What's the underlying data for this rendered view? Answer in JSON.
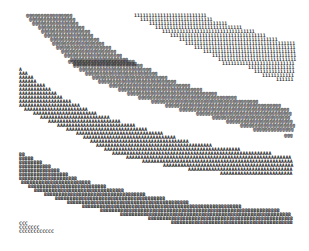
{
  "figure": {
    "char_width": 2.9,
    "row_height": 3.9,
    "bands": [
      {
        "name": "band-at",
        "char": "@",
        "color": "#222222",
        "rows": [
          {
            "y": 16,
            "x": 26,
            "n": 16
          },
          {
            "y": 20,
            "x": 29,
            "n": 16
          },
          {
            "y": 24,
            "x": 32,
            "n": 16
          },
          {
            "y": 28,
            "x": 38,
            "n": 16
          },
          {
            "y": 32,
            "x": 41,
            "n": 17
          },
          {
            "y": 36,
            "x": 44,
            "n": 17
          },
          {
            "y": 40,
            "x": 50,
            "n": 17
          },
          {
            "y": 44,
            "x": 52,
            "n": 18
          },
          {
            "y": 48,
            "x": 56,
            "n": 19
          },
          {
            "y": 52,
            "x": 61,
            "n": 19
          },
          {
            "y": 56,
            "x": 64,
            "n": 20
          },
          {
            "y": 60,
            "x": 70,
            "n": 20
          },
          {
            "y": 64,
            "x": 73,
            "n": 22
          }
        ]
      },
      {
        "name": "band-one",
        "char": "1",
        "color": "#333333",
        "rows": [
          {
            "y": 16,
            "x": 134,
            "n": 25
          },
          {
            "y": 20,
            "x": 140,
            "n": 25
          },
          {
            "y": 24,
            "x": 149,
            "n": 27
          },
          {
            "y": 28,
            "x": 155,
            "n": 30
          },
          {
            "y": 32,
            "x": 162,
            "n": 32
          },
          {
            "y": 36,
            "x": 170,
            "n": 33
          },
          {
            "y": 40,
            "x": 179,
            "n": 34
          },
          {
            "y": 44,
            "x": 185,
            "n": 38
          },
          {
            "y": 48,
            "x": 194,
            "n": 35
          },
          {
            "y": 52,
            "x": 203,
            "n": 32
          },
          {
            "y": 56,
            "x": 212,
            "n": 29
          },
          {
            "y": 60,
            "x": 218,
            "n": 27
          },
          {
            "y": 64,
            "x": 222,
            "n": 25
          },
          {
            "y": 68,
            "x": 248,
            "n": 16
          },
          {
            "y": 72,
            "x": 254,
            "n": 14
          },
          {
            "y": 76,
            "x": 262,
            "n": 11
          },
          {
            "y": 80,
            "x": 276,
            "n": 6
          }
        ]
      },
      {
        "name": "band-a",
        "char": "A",
        "color": "#222222",
        "rows": [
          {
            "y": 60,
            "x": 68,
            "n": 0
          },
          {
            "y": 70,
            "x": 19,
            "n": 1
          },
          {
            "y": 74,
            "x": 19,
            "n": 3
          },
          {
            "y": 78,
            "x": 19,
            "n": 5
          },
          {
            "y": 82,
            "x": 19,
            "n": 6
          },
          {
            "y": 86,
            "x": 19,
            "n": 9
          },
          {
            "y": 90,
            "x": 19,
            "n": 11
          },
          {
            "y": 94,
            "x": 19,
            "n": 13
          },
          {
            "y": 98,
            "x": 19,
            "n": 15
          },
          {
            "y": 102,
            "x": 19,
            "n": 18
          },
          {
            "y": 106,
            "x": 19,
            "n": 21
          },
          {
            "y": 110,
            "x": 24,
            "n": 22
          },
          {
            "y": 114,
            "x": 33,
            "n": 22
          },
          {
            "y": 118,
            "x": 40,
            "n": 24
          },
          {
            "y": 122,
            "x": 48,
            "n": 25
          },
          {
            "y": 126,
            "x": 57,
            "n": 27
          },
          {
            "y": 130,
            "x": 66,
            "n": 28
          },
          {
            "y": 134,
            "x": 76,
            "n": 30
          },
          {
            "y": 138,
            "x": 83,
            "n": 32
          },
          {
            "y": 142,
            "x": 90,
            "n": 34
          },
          {
            "y": 146,
            "x": 96,
            "n": 40
          },
          {
            "y": 150,
            "x": 104,
            "n": 47
          },
          {
            "y": 154,
            "x": 112,
            "n": 55
          },
          {
            "y": 158,
            "x": 126,
            "n": 57
          },
          {
            "y": 162,
            "x": 142,
            "n": 52
          },
          {
            "y": 166,
            "x": 163,
            "n": 45
          },
          {
            "y": 170,
            "x": 188,
            "n": 36
          },
          {
            "y": 174,
            "x": 220,
            "n": 25
          }
        ]
      },
      {
        "name": "band-a-upper",
        "char": "@",
        "color": "#222222",
        "rows": [
          {
            "y": 62,
            "x": 68,
            "n": 23
          },
          {
            "y": 66,
            "x": 73,
            "n": 24
          },
          {
            "y": 70,
            "x": 79,
            "n": 25
          },
          {
            "y": 74,
            "x": 85,
            "n": 25
          },
          {
            "y": 78,
            "x": 92,
            "n": 26
          },
          {
            "y": 82,
            "x": 98,
            "n": 27
          },
          {
            "y": 86,
            "x": 109,
            "n": 28
          },
          {
            "y": 90,
            "x": 118,
            "n": 29
          },
          {
            "y": 94,
            "x": 127,
            "n": 31
          },
          {
            "y": 98,
            "x": 138,
            "n": 34
          },
          {
            "y": 102,
            "x": 151,
            "n": 37
          },
          {
            "y": 106,
            "x": 165,
            "n": 40
          },
          {
            "y": 110,
            "x": 179,
            "n": 38
          },
          {
            "y": 114,
            "x": 196,
            "n": 33
          },
          {
            "y": 118,
            "x": 212,
            "n": 27
          },
          {
            "y": 122,
            "x": 226,
            "n": 23
          },
          {
            "y": 126,
            "x": 240,
            "n": 19
          },
          {
            "y": 130,
            "x": 253,
            "n": 14
          },
          {
            "y": 136,
            "x": 284,
            "n": 3
          }
        ]
      },
      {
        "name": "band-b",
        "char": "B",
        "color": "#111111",
        "rows": [
          {
            "y": 155,
            "x": 19,
            "n": 2
          },
          {
            "y": 159,
            "x": 19,
            "n": 5
          },
          {
            "y": 163,
            "x": 19,
            "n": 8
          },
          {
            "y": 167,
            "x": 19,
            "n": 11
          },
          {
            "y": 171,
            "x": 19,
            "n": 14
          },
          {
            "y": 175,
            "x": 19,
            "n": 17
          },
          {
            "y": 179,
            "x": 19,
            "n": 20
          },
          {
            "y": 183,
            "x": 21,
            "n": 24
          },
          {
            "y": 187,
            "x": 28,
            "n": 27
          },
          {
            "y": 191,
            "x": 34,
            "n": 31
          },
          {
            "y": 195,
            "x": 44,
            "n": 35
          },
          {
            "y": 199,
            "x": 55,
            "n": 38
          },
          {
            "y": 203,
            "x": 67,
            "n": 42
          },
          {
            "y": 207,
            "x": 82,
            "n": 55
          },
          {
            "y": 211,
            "x": 100,
            "n": 62
          },
          {
            "y": 215,
            "x": 120,
            "n": 59
          },
          {
            "y": 219,
            "x": 148,
            "n": 50
          },
          {
            "y": 223,
            "x": 171,
            "n": 42
          }
        ]
      },
      {
        "name": "band-c",
        "char": "C",
        "color": "#333333",
        "rows": [
          {
            "y": 224,
            "x": 19,
            "n": 3
          },
          {
            "y": 228,
            "x": 19,
            "n": 7
          },
          {
            "y": 232,
            "x": 19,
            "n": 12
          }
        ]
      }
    ]
  }
}
